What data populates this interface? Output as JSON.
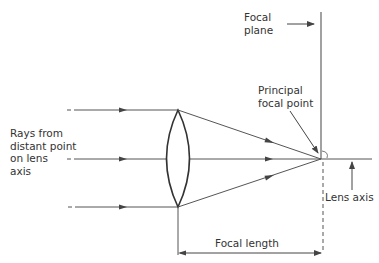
{
  "diagram": {
    "labels": {
      "focal_plane_line1": "Focal",
      "focal_plane_line2": "plane",
      "principal_line1": "Principal",
      "principal_line2": "focal point",
      "rays_line1": "Rays from",
      "rays_line2": "distant point",
      "rays_line3": "on lens",
      "rays_line4": "axis",
      "lens_axis": "Lens axis",
      "focal_length": "Focal length"
    },
    "colors": {
      "line": "#555555",
      "lens": "#333333",
      "text": "#333333",
      "background": "#ffffff"
    }
  }
}
